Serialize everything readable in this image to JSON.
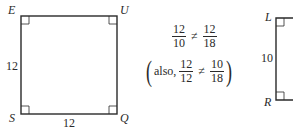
{
  "figure1": {
    "vertices": {
      "top_left": "E",
      "top_right": "U",
      "bottom_left": "S",
      "bottom_right": "Q"
    },
    "side_left": "12",
    "side_bottom": "12"
  },
  "equations": {
    "line1": {
      "left_num": "12",
      "left_den": "10",
      "op": "≠",
      "right_num": "12",
      "right_den": "18"
    },
    "line2": {
      "prefix": "also,",
      "left_num": "12",
      "left_den": "12",
      "op": "≠",
      "right_num": "10",
      "right_den": "18",
      "open_paren": "(",
      "close_paren": ")"
    }
  },
  "figure2": {
    "vertices": {
      "top_left": "L",
      "bottom_left": "R"
    },
    "side_left": "10"
  }
}
